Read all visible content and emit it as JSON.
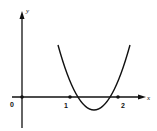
{
  "diagram": {
    "type": "function-graph",
    "axes": {
      "x_label": "x",
      "y_label": "y",
      "origin_label": "0"
    },
    "ticks": [
      {
        "label": "1",
        "x": 1
      },
      {
        "label": "2",
        "x": 2
      }
    ],
    "curve": {
      "kind": "parabola",
      "roots": [
        1,
        2
      ],
      "opens": "up",
      "color": "#111111"
    }
  }
}
